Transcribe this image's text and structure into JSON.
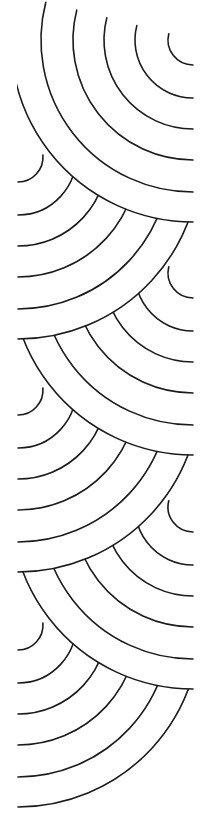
{
  "image": {
    "description": "Decorative seigaiha-style scalloped line pattern strip",
    "width": 214,
    "height": 832,
    "background": "#ffffff",
    "stroke_color": "#1a1a1a"
  },
  "pattern": {
    "right_center_x": 193,
    "left_center_x": 18,
    "radii": [
      25,
      58,
      89,
      120,
      152,
      182
    ],
    "sets": [
      {
        "side": "right",
        "cy": 40
      },
      {
        "side": "left",
        "cy": 157
      },
      {
        "side": "right",
        "cy": 273
      },
      {
        "side": "left",
        "cy": 390
      },
      {
        "side": "right",
        "cy": 507
      },
      {
        "side": "left",
        "cy": 625
      }
    ]
  }
}
